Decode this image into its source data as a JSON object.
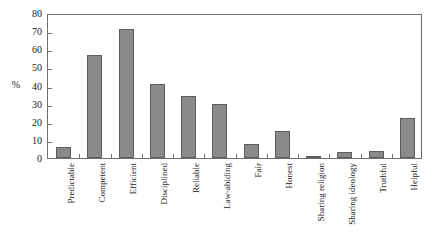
{
  "chart_data": {
    "type": "bar",
    "title": "",
    "subtitle": "",
    "xlabel": "",
    "ylabel": "%",
    "ylim": [
      0,
      80
    ],
    "ytick_step": 10,
    "yticks": [
      0,
      10,
      20,
      30,
      40,
      50,
      60,
      70,
      80
    ],
    "grid": false,
    "legend": null,
    "legend_position": "none",
    "bar_color": "#8a8a8a",
    "bar_edge_color": "#5d5d5d",
    "axis_color": "#6e6e6e",
    "background_color": "#ffffff",
    "categories": [
      "Predictable",
      "Competent",
      "Efficient",
      "Disciplined",
      "Reliable",
      "Law-abiding",
      "Fair",
      "Honest",
      "Sharing religion",
      "Sharing ideology",
      "Truthful",
      "Helpful"
    ],
    "values": [
      6,
      57,
      71,
      41,
      34,
      30,
      8,
      15,
      1,
      3.5,
      4,
      22
    ]
  }
}
